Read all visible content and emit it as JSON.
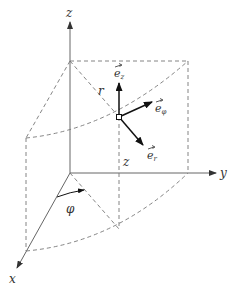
{
  "diagram": {
    "axes": {
      "x": "x",
      "y": "y",
      "z": "z"
    },
    "labels": {
      "radius": "r",
      "height": "z",
      "angle": "φ"
    },
    "unit_vectors": [
      {
        "name": "e_z",
        "base": "e",
        "subscript": "z"
      },
      {
        "name": "e_phi",
        "base": "e",
        "subscript": "φ"
      },
      {
        "name": "e_r",
        "base": "e",
        "subscript": "r"
      }
    ]
  }
}
